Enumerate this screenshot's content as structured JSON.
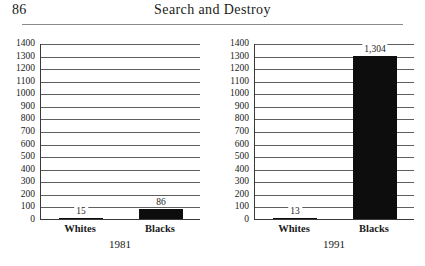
{
  "page": {
    "folio": "86",
    "running_head": "Search and Destroy"
  },
  "chart_data": [
    {
      "type": "bar",
      "title": "1981",
      "categories": [
        "Whites",
        "Blacks"
      ],
      "values": [
        15,
        86
      ],
      "value_labels": [
        "15",
        "86"
      ],
      "xlabel": "",
      "ylabel": "",
      "ylim": [
        0,
        1400
      ],
      "ytick_step": 100,
      "yticks": [
        1400,
        1300,
        1200,
        1100,
        1000,
        900,
        800,
        700,
        600,
        500,
        400,
        300,
        200,
        100,
        0
      ],
      "grid": true,
      "legend": "none",
      "bar_color": "#0d0d0d"
    },
    {
      "type": "bar",
      "title": "1991",
      "categories": [
        "Whites",
        "Blacks"
      ],
      "values": [
        13,
        1304
      ],
      "value_labels": [
        "13",
        "1,304"
      ],
      "xlabel": "",
      "ylabel": "",
      "ylim": [
        0,
        1400
      ],
      "ytick_step": 100,
      "yticks": [
        1400,
        1300,
        1200,
        1100,
        1000,
        900,
        800,
        700,
        600,
        500,
        400,
        300,
        200,
        100,
        0
      ],
      "grid": true,
      "legend": "none",
      "bar_color": "#0d0d0d"
    }
  ]
}
